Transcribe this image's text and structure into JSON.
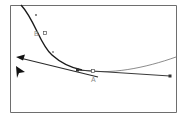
{
  "diagram": {
    "type": "bezier-curve-editing",
    "frame": {
      "stroke": "#6e6e6e"
    },
    "colors": {
      "curve": "#1a1a1a",
      "curve_extension": "#8c8c8c",
      "handle_line": "#3a3a3a",
      "arrow": "#2a2a2a",
      "point_fill": "#ffffff",
      "point_stroke": "#555555",
      "label": "#8a8a8a",
      "cursor": "#111111"
    },
    "points": [
      {
        "id": "B",
        "label": "B"
      },
      {
        "id": "A",
        "label": "A"
      }
    ],
    "labels": {
      "point_b": "B",
      "point_a": "A"
    }
  }
}
